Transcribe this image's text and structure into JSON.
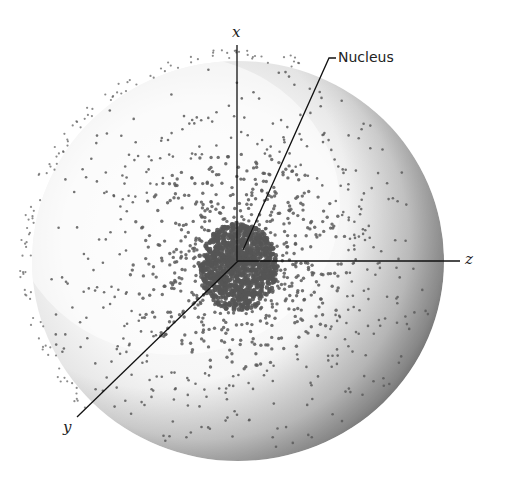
{
  "figure": {
    "labels": {
      "x_axis": "x",
      "y_axis": "y",
      "z_axis": "z",
      "nucleus": "Nucleus"
    },
    "geometry": {
      "center": [
        238,
        261
      ],
      "radius_x": 206,
      "radius_y": 200,
      "x_axis_top": [
        237,
        45
      ],
      "z_axis_end": [
        460,
        261
      ],
      "y_axis_end": [
        77,
        417
      ],
      "nucleus_leader": [
        [
          243,
          250
        ],
        [
          329,
          58
        ],
        [
          336,
          58
        ]
      ]
    },
    "colors": {
      "background": "#ffffff",
      "dot": "#5a5a5a",
      "dense_core": "#555555",
      "shadow": "#6e6e6e",
      "line": "#111111",
      "sphere_fill": "#efefef"
    },
    "dot_field": {
      "core_radius": 38,
      "inner_count": 2200,
      "outer_halo_count": 120
    }
  }
}
